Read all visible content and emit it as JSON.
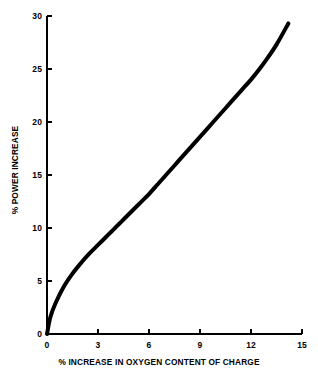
{
  "chart_data": {
    "type": "line",
    "title": "",
    "subtitle": "",
    "xlabel": "% INCREASE IN OXYGEN CONTENT OF CHARGE",
    "ylabel": "% POWER INCREASE",
    "xlim": [
      0,
      15
    ],
    "ylim": [
      0,
      30
    ],
    "xticks": [
      "0",
      "3",
      "6",
      "9",
      "12",
      "15"
    ],
    "xtick_values": [
      0,
      3,
      6,
      9,
      12,
      15
    ],
    "yticks": [
      "0",
      "5",
      "10",
      "15",
      "20",
      "25",
      "30"
    ],
    "ytick_values": [
      0,
      5,
      10,
      15,
      20,
      25,
      30
    ],
    "grid": false,
    "legend": false,
    "legend_position": "none",
    "line_color": "#000000",
    "line_width": 4,
    "axis_color": "#000000",
    "background_color": "#ffffff",
    "series": [
      {
        "name": "Power increase vs oxygen enrichment",
        "x": [
          0.0,
          0.2,
          0.5,
          1.0,
          1.5,
          2.0,
          2.5,
          3.0,
          3.5,
          4.0,
          4.5,
          5.0,
          5.5,
          6.0,
          6.5,
          7.0,
          7.5,
          8.0,
          8.5,
          9.0,
          9.5,
          10.0,
          10.5,
          11.0,
          11.5,
          12.0,
          12.5,
          13.0,
          13.5,
          14.2
        ],
        "values": [
          0.0,
          1.6,
          2.9,
          4.5,
          5.7,
          6.7,
          7.6,
          8.4,
          9.2,
          10.0,
          10.8,
          11.6,
          12.4,
          13.2,
          14.1,
          15.0,
          15.9,
          16.8,
          17.7,
          18.6,
          19.5,
          20.4,
          21.3,
          22.2,
          23.1,
          24.0,
          25.0,
          26.1,
          27.3,
          29.3
        ]
      }
    ],
    "annotations": []
  },
  "axes_geometry": {
    "plot_left": 47,
    "plot_right": 302,
    "plot_top": 16,
    "plot_bottom": 334,
    "tick_length": 5
  }
}
